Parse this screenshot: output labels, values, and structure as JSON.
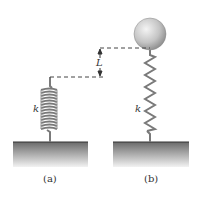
{
  "diagram": {
    "panel_a": {
      "label": "(a)",
      "spring_label": "k"
    },
    "panel_b": {
      "label": "(b)",
      "spring_label": "k"
    },
    "dimension_label": "L",
    "colors": {
      "ground_top": "#555555",
      "ground_bottom": "#f0f0f0",
      "spring": "#777777",
      "ball": "#bdbdbd",
      "dash": "#444444"
    }
  }
}
